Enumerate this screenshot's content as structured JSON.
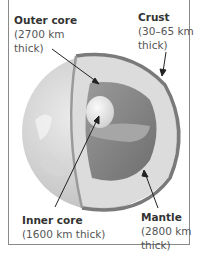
{
  "diagram": {
    "labels": [
      {
        "name": "Outer core",
        "detail_lines": [
          "(2700 km",
          "thick)"
        ]
      },
      {
        "name": "Crust",
        "detail_lines": [
          "(30–65 km",
          "thick)"
        ]
      },
      {
        "name": "Inner core",
        "detail_lines": [
          "(1600 km thick)"
        ]
      },
      {
        "name": "Mantle",
        "detail_lines": [
          "(2800 km",
          "thick)"
        ]
      }
    ],
    "colors": {
      "crust": "#7a7a7a",
      "mantle": "#d8d8d8",
      "outer_core": "#8c8c8c",
      "inner_core": "#e6e6e6",
      "surface": "#c4c4c4",
      "text": "#444444",
      "border": "#8a8a8a"
    }
  }
}
